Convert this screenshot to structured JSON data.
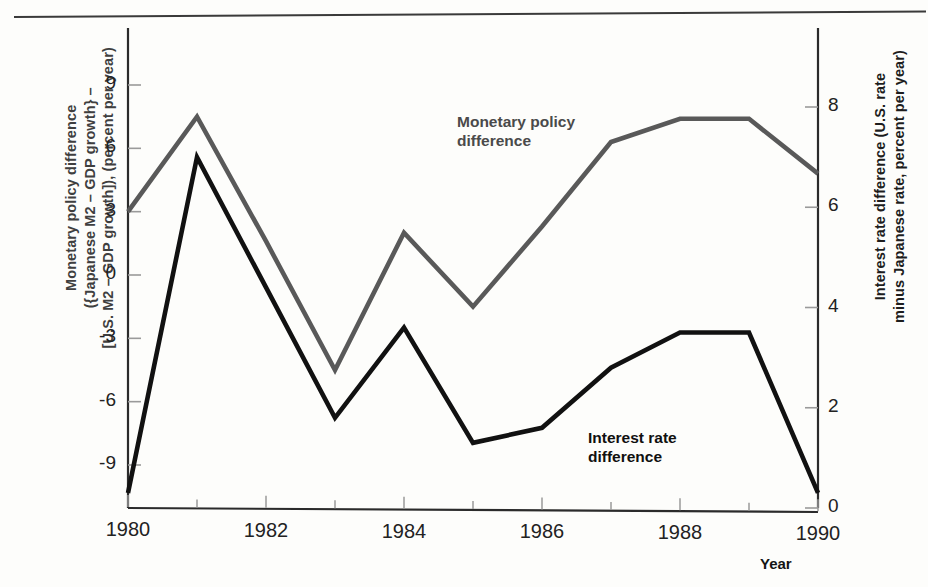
{
  "figure": {
    "top_sliver_text": "",
    "axis_left_title": "Monetary policy difference ({Japanese M2 – GDP growth} – [U.S. M2 – GDP growth]), (percent per year)",
    "axis_left_title_line1": "Monetary policy difference",
    "axis_left_title_line2": "({Japanese M2 – GDP growth} –",
    "axis_left_title_line3": "[U.S. M2 – GDP growth]), (percent per year)",
    "axis_right_title_line1": "Interest rate difference (U.S. rate",
    "axis_right_title_line2": "minus Japanese rate, percent per year)",
    "axis_x_title": "Year",
    "label_monetary_line1": "Monetary policy",
    "label_monetary_line2": "difference",
    "label_interest_line1": "Interest rate",
    "label_interest_line2": "difference",
    "color_monetary": "#595959",
    "color_interest": "#111111"
  },
  "chart_data": {
    "type": "line",
    "title": "",
    "xlabel": "Year",
    "x": [
      1980,
      1981,
      1982,
      1983,
      1984,
      1985,
      1986,
      1987,
      1988,
      1989,
      1990
    ],
    "xlim": [
      1980,
      1990
    ],
    "xticks": [
      1980,
      1982,
      1984,
      1986,
      1988,
      1990
    ],
    "xticklabels": [
      "1980",
      "1982",
      "1984",
      "1986",
      "1988",
      "1990"
    ],
    "xminorticks": [
      1981,
      1983,
      1985,
      1987,
      1989
    ],
    "grid": false,
    "legend": "inline-annotations",
    "axes": [
      {
        "id": "left",
        "label": "Monetary policy difference ({Japanese M2 – GDP growth} – [U.S. M2 – GDP growth]), (percent per year)",
        "ticks": [
          9,
          6,
          3,
          0,
          -3,
          -6,
          -9
        ],
        "ticklabels": [
          "9",
          "6",
          "3",
          "0",
          "-3",
          "-6",
          "-9"
        ],
        "lim": [
          -10.5,
          10.2
        ]
      },
      {
        "id": "right",
        "label": "Interest rate difference (U.S. rate minus Japanese rate, percent per year)",
        "ticks": [
          0,
          2,
          4,
          6,
          8
        ],
        "ticklabels": [
          "0",
          "2",
          "4",
          "6",
          "8"
        ],
        "lim": [
          0,
          8.9
        ]
      }
    ],
    "series": [
      {
        "name": "Monetary policy difference",
        "axis": "left",
        "color": "#595959",
        "values": [
          3.0,
          7.5,
          1.6,
          -4.5,
          2.0,
          -1.5,
          2.3,
          6.3,
          7.4,
          7.4,
          4.8
        ]
      },
      {
        "name": "Interest rate difference",
        "axis": "right",
        "color": "#111111",
        "values": [
          0.3,
          7.0,
          4.4,
          1.8,
          3.6,
          1.3,
          1.6,
          2.8,
          3.5,
          3.5,
          0.3
        ]
      }
    ]
  }
}
